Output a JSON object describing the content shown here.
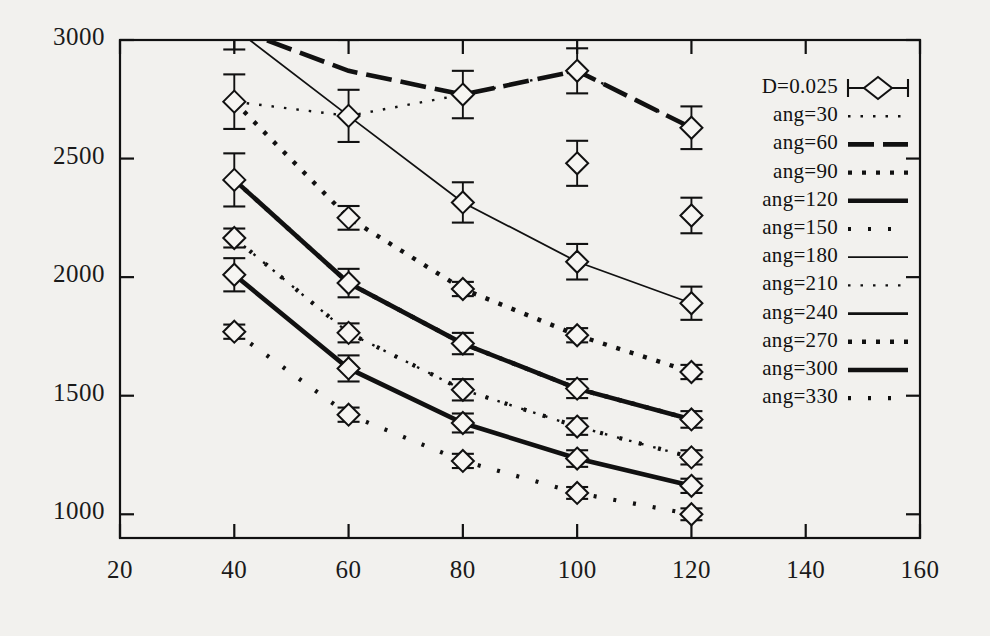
{
  "chart_data": {
    "type": "line",
    "title": "",
    "xlabel": "",
    "ylabel": "",
    "xlim": [
      20,
      160
    ],
    "ylim": [
      900,
      3000
    ],
    "xticks": [
      "20",
      "40",
      "60",
      "80",
      "100",
      "120",
      "140",
      "160"
    ],
    "yticks": [
      "1000",
      "1500",
      "2000",
      "2500",
      "3000"
    ],
    "grid": false,
    "legend_position": "inside-top-right",
    "x": [
      40,
      60,
      80,
      100,
      120
    ],
    "series": [
      {
        "name": "D=0.025",
        "style": "errorbar-diamond",
        "values": [
          null,
          null,
          null,
          null,
          null
        ],
        "errors": [
          null,
          null,
          null,
          null,
          null
        ]
      },
      {
        "name": "ang=30",
        "style": "dotted-fine",
        "values": [
          2740,
          2680,
          2770,
          2870,
          2630
        ],
        "errors": [
          115,
          105,
          100,
          95,
          90
        ]
      },
      {
        "name": "ang=60",
        "style": "dashed-thick",
        "values": [
          3050,
          2870,
          2770,
          2870,
          2630
        ],
        "errors": [
          120,
          110,
          100,
          95,
          90
        ]
      },
      {
        "name": "ang=90",
        "style": "dotted-bold",
        "values": [
          2740,
          2250,
          1950,
          1755,
          1600
        ],
        "errors": [
          115,
          50,
          30,
          30,
          30
        ]
      },
      {
        "name": "ang=120",
        "style": "solid-thick",
        "values": [
          2410,
          1975,
          1720,
          1530,
          1400
        ],
        "errors": [
          110,
          60,
          45,
          40,
          35
        ]
      },
      {
        "name": "ang=150",
        "style": "dotted-sparse",
        "values": [
          2165,
          1765,
          1525,
          1370,
          1240
        ],
        "errors": [
          40,
          40,
          45,
          35,
          30
        ]
      },
      {
        "name": "ang=180",
        "style": "solid-thin",
        "values": [
          3050,
          2680,
          2315,
          2065,
          1890
        ],
        "errors": [
          120,
          110,
          85,
          75,
          70
        ]
      },
      {
        "name": "ang=210",
        "style": "dotted-fine",
        "values": [
          2165,
          1765,
          1525,
          1370,
          1240
        ],
        "errors": [
          40,
          40,
          45,
          35,
          30
        ]
      },
      {
        "name": "ang=240",
        "style": "solid-medium",
        "values": [
          2010,
          1615,
          1385,
          1235,
          1120
        ],
        "errors": [
          70,
          55,
          40,
          35,
          30
        ]
      },
      {
        "name": "ang=270",
        "style": "dotted-bold",
        "values": [
          2410,
          1975,
          1720,
          1530,
          1400
        ],
        "errors": [
          110,
          60,
          45,
          40,
          35
        ]
      },
      {
        "name": "ang=300",
        "style": "solid-thick",
        "values": [
          2010,
          1615,
          1385,
          1235,
          1120
        ],
        "errors": [
          70,
          55,
          40,
          35,
          30
        ]
      },
      {
        "name": "ang=330",
        "style": "dotted-sparse",
        "values": [
          1770,
          1420,
          1225,
          1090,
          1000
        ],
        "errors": [
          30,
          30,
          30,
          25,
          25
        ]
      }
    ],
    "markers": [
      {
        "x": 40,
        "y": 2740,
        "err": 115
      },
      {
        "x": 40,
        "y": 2410,
        "err": 112
      },
      {
        "x": 40,
        "y": 2165,
        "err": 40
      },
      {
        "x": 40,
        "y": 2010,
        "err": 70
      },
      {
        "x": 40,
        "y": 1770,
        "err": 30
      },
      {
        "x": 60,
        "y": 2680,
        "err": 110
      },
      {
        "x": 60,
        "y": 2250,
        "err": 50
      },
      {
        "x": 60,
        "y": 1975,
        "err": 60
      },
      {
        "x": 60,
        "y": 1765,
        "err": 40
      },
      {
        "x": 60,
        "y": 1615,
        "err": 55
      },
      {
        "x": 60,
        "y": 1420,
        "err": 30
      },
      {
        "x": 80,
        "y": 2770,
        "err": 100
      },
      {
        "x": 80,
        "y": 2315,
        "err": 85
      },
      {
        "x": 80,
        "y": 1950,
        "err": 30
      },
      {
        "x": 80,
        "y": 1720,
        "err": 45
      },
      {
        "x": 80,
        "y": 1525,
        "err": 45
      },
      {
        "x": 80,
        "y": 1385,
        "err": 40
      },
      {
        "x": 80,
        "y": 1225,
        "err": 30
      },
      {
        "x": 100,
        "y": 2870,
        "err": 95
      },
      {
        "x": 100,
        "y": 2480,
        "err": 95
      },
      {
        "x": 100,
        "y": 2065,
        "err": 75
      },
      {
        "x": 100,
        "y": 1755,
        "err": 30
      },
      {
        "x": 100,
        "y": 1530,
        "err": 40
      },
      {
        "x": 100,
        "y": 1370,
        "err": 35
      },
      {
        "x": 100,
        "y": 1235,
        "err": 35
      },
      {
        "x": 100,
        "y": 1090,
        "err": 25
      },
      {
        "x": 120,
        "y": 2630,
        "err": 90
      },
      {
        "x": 120,
        "y": 2260,
        "err": 75
      },
      {
        "x": 120,
        "y": 1890,
        "err": 70
      },
      {
        "x": 120,
        "y": 1600,
        "err": 30
      },
      {
        "x": 120,
        "y": 1400,
        "err": 35
      },
      {
        "x": 120,
        "y": 1240,
        "err": 30
      },
      {
        "x": 120,
        "y": 1120,
        "err": 30
      },
      {
        "x": 120,
        "y": 1000,
        "err": 25
      }
    ]
  },
  "axes": {
    "y_labels": [
      "3000",
      "2500",
      "2000",
      "1500",
      "1000"
    ],
    "x_labels": [
      "20",
      "40",
      "60",
      "80",
      "100",
      "120",
      "140",
      "160"
    ]
  },
  "legend": {
    "entries": [
      {
        "label": "D=0.025",
        "style": "errorbar-diamond"
      },
      {
        "label": "ang=30",
        "style": "dotted-fine"
      },
      {
        "label": "ang=60",
        "style": "dashed-thick"
      },
      {
        "label": "ang=90",
        "style": "dotted-bold"
      },
      {
        "label": "ang=120",
        "style": "solid-thick"
      },
      {
        "label": "ang=150",
        "style": "dotted-sparse"
      },
      {
        "label": "ang=180",
        "style": "solid-thin"
      },
      {
        "label": "ang=210",
        "style": "dotted-fine"
      },
      {
        "label": "ang=240",
        "style": "solid-medium"
      },
      {
        "label": "ang=270",
        "style": "dotted-bold"
      },
      {
        "label": "ang=300",
        "style": "solid-thick"
      },
      {
        "label": "ang=330",
        "style": "dotted-sparse"
      }
    ]
  },
  "colors": {
    "background": "#f2f1ee",
    "ink": "#111111",
    "axis": "#1a1a1a"
  }
}
